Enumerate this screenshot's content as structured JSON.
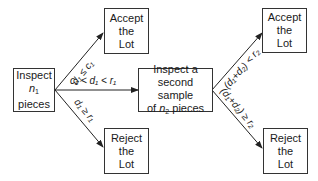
{
  "nodes": {
    "inspect_first": {
      "line1": "Inspect",
      "var": "n",
      "sub": "1",
      "line3": "pieces"
    },
    "accept_first": {
      "line1": "Accept",
      "line2": "the",
      "line3": "Lot"
    },
    "reject_first": {
      "line1": "Reject",
      "line2": "the",
      "line3": "Lot"
    },
    "inspect_second": {
      "line1": "Inspect a",
      "line2": "second sample",
      "line3_pre": "of ",
      "var": "n",
      "sub": "2",
      "line3_post": " pieces"
    },
    "accept_second": {
      "line1": "Accept",
      "line2": "the",
      "line3": "Lot"
    },
    "reject_second": {
      "line1": "Reject",
      "line2": "the",
      "line3": "Lot"
    }
  },
  "edges": {
    "accept1": {
      "label": "d₁ ≤ c₁"
    },
    "continue": {
      "label": "c₁ < d₁ < r₁"
    },
    "reject1": {
      "label": "d₁ ≥ r₁"
    },
    "accept2": {
      "label": "(d₁+d₂) < r₂"
    },
    "reject2": {
      "label": "(d₁+d₂) ≥ r₂"
    }
  }
}
